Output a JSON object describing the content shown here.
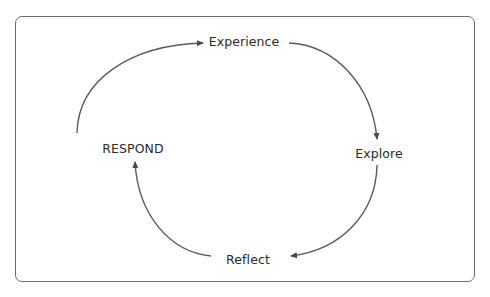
{
  "diagram": {
    "type": "cycle",
    "colors": {
      "stroke": "#5a5a5a",
      "text": "#2a2a2a",
      "frame": "#6a6a6a"
    },
    "nodes": [
      {
        "id": "experience",
        "label": "Experience"
      },
      {
        "id": "explore",
        "label": "Explore"
      },
      {
        "id": "reflect",
        "label": "Reflect"
      },
      {
        "id": "respond",
        "label": "RESPOND"
      }
    ],
    "edges": [
      {
        "from": "respond",
        "to": "experience"
      },
      {
        "from": "experience",
        "to": "explore"
      },
      {
        "from": "explore",
        "to": "reflect"
      },
      {
        "from": "reflect",
        "to": "respond"
      }
    ]
  }
}
